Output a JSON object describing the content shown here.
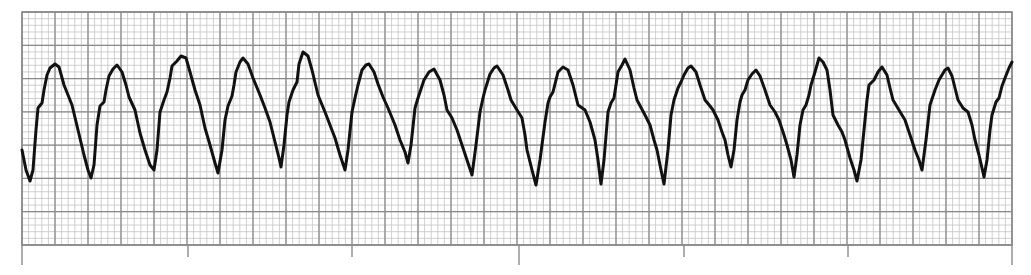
{
  "strip": {
    "label": "ECG rhythm strip",
    "width": 1031,
    "height": 275,
    "background": "#ffffff",
    "grid": {
      "left": 22,
      "top": 12,
      "right": 1012,
      "bottom": 245,
      "minor_spacing": 6.6,
      "major_spacing": 33,
      "minor_color": "#c4c4c4",
      "major_color": "#8a8a8a",
      "border_color": "#8a8a8a"
    },
    "ticks": [
      {
        "x": 22,
        "y2": 265,
        "kind": "long"
      },
      {
        "x": 188,
        "y2": 257,
        "kind": "short"
      },
      {
        "x": 352,
        "y2": 257,
        "kind": "short"
      },
      {
        "x": 519,
        "y2": 265,
        "kind": "long"
      },
      {
        "x": 684,
        "y2": 257,
        "kind": "short"
      },
      {
        "x": 848,
        "y2": 257,
        "kind": "short"
      },
      {
        "x": 1012,
        "y2": 265,
        "kind": "long"
      }
    ],
    "trace_color": "#111111",
    "trace_width": 3
  },
  "chart_data": {
    "type": "line",
    "title": "",
    "xlabel": "",
    "ylabel": "",
    "grid": true,
    "complex_count": 16,
    "points": [
      [
        22,
        150
      ],
      [
        26,
        170
      ],
      [
        30,
        181
      ],
      [
        33,
        170
      ],
      [
        36,
        130
      ],
      [
        38,
        108
      ],
      [
        42,
        103
      ],
      [
        44,
        90
      ],
      [
        47,
        75
      ],
      [
        50,
        68
      ],
      [
        55,
        64
      ],
      [
        59,
        67
      ],
      [
        64,
        85
      ],
      [
        68,
        95
      ],
      [
        72,
        105
      ],
      [
        78,
        130
      ],
      [
        84,
        155
      ],
      [
        88,
        170
      ],
      [
        91,
        178
      ],
      [
        94,
        165
      ],
      [
        97,
        125
      ],
      [
        100,
        106
      ],
      [
        104,
        102
      ],
      [
        106,
        90
      ],
      [
        109,
        76
      ],
      [
        113,
        69
      ],
      [
        117,
        65
      ],
      [
        122,
        72
      ],
      [
        126,
        85
      ],
      [
        129,
        97
      ],
      [
        135,
        110
      ],
      [
        140,
        133
      ],
      [
        145,
        150
      ],
      [
        150,
        165
      ],
      [
        154,
        170
      ],
      [
        157,
        150
      ],
      [
        160,
        112
      ],
      [
        164,
        100
      ],
      [
        167,
        92
      ],
      [
        170,
        78
      ],
      [
        172,
        66
      ],
      [
        177,
        61
      ],
      [
        181,
        56
      ],
      [
        186,
        58
      ],
      [
        190,
        72
      ],
      [
        195,
        90
      ],
      [
        200,
        105
      ],
      [
        205,
        128
      ],
      [
        210,
        145
      ],
      [
        215,
        163
      ],
      [
        218,
        173
      ],
      [
        222,
        150
      ],
      [
        225,
        120
      ],
      [
        228,
        106
      ],
      [
        232,
        96
      ],
      [
        234,
        85
      ],
      [
        236,
        72
      ],
      [
        240,
        62
      ],
      [
        243,
        58
      ],
      [
        248,
        64
      ],
      [
        253,
        78
      ],
      [
        260,
        95
      ],
      [
        265,
        108
      ],
      [
        270,
        122
      ],
      [
        275,
        142
      ],
      [
        279,
        158
      ],
      [
        281,
        167
      ],
      [
        284,
        145
      ],
      [
        287,
        115
      ],
      [
        289,
        102
      ],
      [
        293,
        90
      ],
      [
        297,
        82
      ],
      [
        299,
        64
      ],
      [
        303,
        52
      ],
      [
        308,
        56
      ],
      [
        312,
        70
      ],
      [
        318,
        95
      ],
      [
        325,
        112
      ],
      [
        330,
        125
      ],
      [
        335,
        138
      ],
      [
        340,
        155
      ],
      [
        345,
        170
      ],
      [
        348,
        150
      ],
      [
        352,
        112
      ],
      [
        355,
        98
      ],
      [
        358,
        85
      ],
      [
        362,
        70
      ],
      [
        366,
        65
      ],
      [
        369,
        64
      ],
      [
        374,
        72
      ],
      [
        378,
        84
      ],
      [
        383,
        97
      ],
      [
        388,
        108
      ],
      [
        395,
        125
      ],
      [
        400,
        140
      ],
      [
        405,
        152
      ],
      [
        408,
        163
      ],
      [
        411,
        145
      ],
      [
        415,
        108
      ],
      [
        418,
        98
      ],
      [
        420,
        92
      ],
      [
        424,
        80
      ],
      [
        429,
        72
      ],
      [
        434,
        69
      ],
      [
        440,
        80
      ],
      [
        444,
        95
      ],
      [
        447,
        110
      ],
      [
        452,
        118
      ],
      [
        457,
        130
      ],
      [
        462,
        145
      ],
      [
        467,
        160
      ],
      [
        472,
        175
      ],
      [
        476,
        145
      ],
      [
        480,
        112
      ],
      [
        483,
        98
      ],
      [
        485,
        90
      ],
      [
        490,
        74
      ],
      [
        494,
        68
      ],
      [
        497,
        66
      ],
      [
        503,
        75
      ],
      [
        508,
        90
      ],
      [
        511,
        100
      ],
      [
        517,
        110
      ],
      [
        522,
        118
      ],
      [
        525,
        135
      ],
      [
        527,
        150
      ],
      [
        532,
        170
      ],
      [
        536,
        185
      ],
      [
        540,
        160
      ],
      [
        545,
        122
      ],
      [
        548,
        103
      ],
      [
        550,
        97
      ],
      [
        553,
        92
      ],
      [
        556,
        80
      ],
      [
        558,
        72
      ],
      [
        563,
        67
      ],
      [
        568,
        70
      ],
      [
        573,
        85
      ],
      [
        578,
        105
      ],
      [
        585,
        110
      ],
      [
        590,
        122
      ],
      [
        595,
        140
      ],
      [
        598,
        160
      ],
      [
        601,
        184
      ],
      [
        604,
        160
      ],
      [
        608,
        112
      ],
      [
        611,
        103
      ],
      [
        614,
        98
      ],
      [
        616,
        85
      ],
      [
        618,
        72
      ],
      [
        622,
        65
      ],
      [
        625,
        59
      ],
      [
        630,
        70
      ],
      [
        634,
        88
      ],
      [
        637,
        100
      ],
      [
        645,
        115
      ],
      [
        650,
        125
      ],
      [
        654,
        140
      ],
      [
        657,
        150
      ],
      [
        661,
        170
      ],
      [
        664,
        184
      ],
      [
        668,
        150
      ],
      [
        671,
        115
      ],
      [
        674,
        100
      ],
      [
        678,
        88
      ],
      [
        681,
        82
      ],
      [
        684,
        75
      ],
      [
        688,
        68
      ],
      [
        691,
        66
      ],
      [
        696,
        72
      ],
      [
        700,
        85
      ],
      [
        705,
        100
      ],
      [
        710,
        106
      ],
      [
        713,
        110
      ],
      [
        718,
        120
      ],
      [
        722,
        132
      ],
      [
        725,
        140
      ],
      [
        728,
        155
      ],
      [
        731,
        167
      ],
      [
        734,
        150
      ],
      [
        737,
        120
      ],
      [
        740,
        102
      ],
      [
        742,
        95
      ],
      [
        745,
        90
      ],
      [
        748,
        80
      ],
      [
        752,
        74
      ],
      [
        756,
        70
      ],
      [
        760,
        76
      ],
      [
        765,
        90
      ],
      [
        770,
        105
      ],
      [
        775,
        112
      ],
      [
        779,
        120
      ],
      [
        784,
        135
      ],
      [
        787,
        145
      ],
      [
        791,
        160
      ],
      [
        794,
        177
      ],
      [
        797,
        155
      ],
      [
        800,
        125
      ],
      [
        803,
        110
      ],
      [
        806,
        105
      ],
      [
        809,
        95
      ],
      [
        811,
        85
      ],
      [
        815,
        72
      ],
      [
        819,
        58
      ],
      [
        823,
        62
      ],
      [
        827,
        70
      ],
      [
        830,
        90
      ],
      [
        833,
        115
      ],
      [
        838,
        125
      ],
      [
        842,
        132
      ],
      [
        845,
        140
      ],
      [
        850,
        158
      ],
      [
        854,
        170
      ],
      [
        857,
        181
      ],
      [
        861,
        160
      ],
      [
        865,
        120
      ],
      [
        867,
        100
      ],
      [
        869,
        85
      ],
      [
        874,
        80
      ],
      [
        878,
        72
      ],
      [
        882,
        67
      ],
      [
        887,
        75
      ],
      [
        890,
        88
      ],
      [
        893,
        100
      ],
      [
        899,
        110
      ],
      [
        905,
        120
      ],
      [
        910,
        135
      ],
      [
        915,
        150
      ],
      [
        919,
        160
      ],
      [
        922,
        170
      ],
      [
        926,
        140
      ],
      [
        930,
        105
      ],
      [
        933,
        96
      ],
      [
        935,
        90
      ],
      [
        939,
        80
      ],
      [
        942,
        75
      ],
      [
        945,
        70
      ],
      [
        948,
        68
      ],
      [
        952,
        76
      ],
      [
        955,
        88
      ],
      [
        958,
        100
      ],
      [
        963,
        108
      ],
      [
        968,
        112
      ],
      [
        972,
        125
      ],
      [
        975,
        140
      ],
      [
        979,
        155
      ],
      [
        982,
        168
      ],
      [
        984,
        177
      ],
      [
        987,
        160
      ],
      [
        990,
        130
      ],
      [
        992,
        115
      ],
      [
        996,
        102
      ],
      [
        999,
        98
      ],
      [
        1002,
        86
      ],
      [
        1005,
        78
      ],
      [
        1009,
        68
      ],
      [
        1012,
        62
      ]
    ],
    "peaks_x": [
      55,
      117,
      181,
      243,
      303,
      369,
      434,
      497,
      563,
      625,
      691,
      756,
      819,
      882,
      948
    ],
    "troughs_x": [
      30,
      91,
      154,
      218,
      281,
      345,
      408,
      472,
      536,
      601,
      664,
      731,
      794,
      857,
      922,
      984
    ]
  }
}
